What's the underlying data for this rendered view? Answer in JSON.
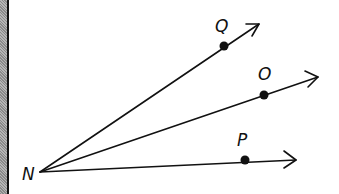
{
  "diagram": {
    "vertex": {
      "label": "N",
      "x": 40,
      "y": 172
    },
    "rays": [
      {
        "name": "NQ",
        "point_label": "Q",
        "point": [
          224,
          46
        ],
        "end": [
          259,
          24
        ]
      },
      {
        "name": "NO",
        "point_label": "O",
        "point": [
          264,
          95
        ],
        "end": [
          318,
          77
        ]
      },
      {
        "name": "NP",
        "point_label": "P",
        "point": [
          245,
          160
        ],
        "end": [
          296,
          160
        ]
      }
    ],
    "colors": {
      "stroke": "#111111",
      "border": "#888888"
    }
  }
}
